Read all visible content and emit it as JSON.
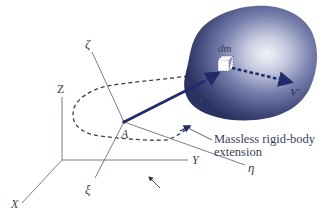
{
  "figure": {
    "type": "3D rigid body kinematics diagram",
    "colors": {
      "axis": "#6a6e80",
      "body_dark": "#2c3566",
      "body_mid": "#5b6496",
      "body_light": "#eef0f6",
      "rod": "#1f2b6b",
      "dashed_path": "#3a3f55",
      "label": "#3a3f55"
    },
    "inertial_axes": {
      "labels": {
        "x": "X",
        "y": "Y",
        "z": "Z"
      }
    },
    "body_axes": {
      "labels": {
        "xi": "ξ",
        "eta": "η",
        "zeta": "ζ"
      }
    },
    "points": {
      "reference_point": "A",
      "mass_element": "dm"
    },
    "vectors": {
      "position": "ρ",
      "velocity": "V'"
    },
    "annotation": {
      "line1": "Massless rigid-body",
      "line2": "extension"
    }
  }
}
